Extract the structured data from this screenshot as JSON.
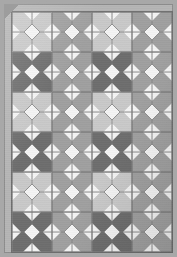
{
  "image": {
    "title": "Geometric tiled rug pattern",
    "subject": "repeating octagon-and-diamond mosaic tile field",
    "width_px": 177,
    "height_px": 257
  },
  "palette": {
    "background": "#a8a8a8",
    "mat": "#b5b5b5",
    "grout": "#9a9a9a",
    "border_line": "#6f6f6f",
    "tile_light": "#c9c9c9",
    "tile_medium": "#a0a0a0",
    "tile_dark": "#6e6e6e",
    "notch_white": "#f4f4f4",
    "seam_line": "#7d7d7d"
  },
  "pattern": {
    "type": "tile-mosaic",
    "columns": 4,
    "rows": 6,
    "cell_size_px": 40,
    "grid_origin_px": [
      8,
      8
    ],
    "motif": "octagon with four white edge triangles and a central white diamond",
    "tones": [
      "light",
      "medium",
      "dark"
    ],
    "tone_grid": [
      [
        "light",
        "medium",
        "light",
        "medium"
      ],
      [
        "dark",
        "medium",
        "dark",
        "medium"
      ],
      [
        "light",
        "medium",
        "light",
        "medium"
      ],
      [
        "dark",
        "medium",
        "dark",
        "medium"
      ],
      [
        "light",
        "medium",
        "light",
        "medium"
      ],
      [
        "dark",
        "medium",
        "dark",
        "medium"
      ]
    ]
  }
}
